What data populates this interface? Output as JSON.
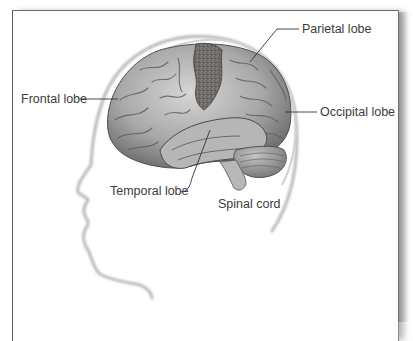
{
  "diagram": {
    "labels": {
      "parietal": "Parietal lobe",
      "frontal": "Frontal lobe",
      "occipital": "Occipital lobe",
      "temporal": "Temporal lobe",
      "spinal": "Spinal cord"
    },
    "colors": {
      "frame_border": "#5a5a5a",
      "label_text": "#3c3c3c",
      "leader_line": "#333333",
      "brain_mid": "#9a9a9a",
      "brain_light": "#d4d4d4",
      "brain_dark": "#5c5c5c",
      "motor_cortex": "#6e6a66",
      "silhouette": "#bdbdbd"
    }
  }
}
